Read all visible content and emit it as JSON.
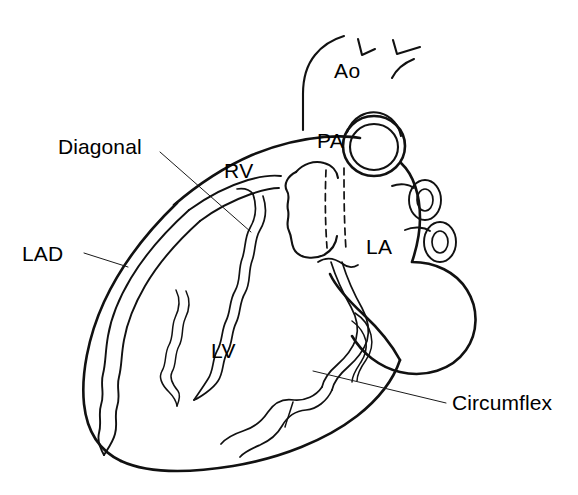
{
  "figure": {
    "background_color": "#ffffff",
    "ink_color": "#111111",
    "width": 578,
    "height": 495
  },
  "callout_labels": [
    {
      "id": "diagonal",
      "text": "Diagonal",
      "x": 58,
      "y": 136,
      "leader_from": [
        160,
        152
      ],
      "leader_to": [
        251,
        232
      ]
    },
    {
      "id": "lad",
      "text": "LAD",
      "x": 22,
      "y": 243,
      "leader_from": [
        84,
        253
      ],
      "leader_to": [
        128,
        267
      ]
    },
    {
      "id": "circumflex",
      "text": "Circumflex",
      "x": 452,
      "y": 392,
      "leader_from": [
        446,
        403
      ],
      "leader_to": [
        313,
        371
      ]
    }
  ],
  "chamber_labels": [
    {
      "id": "ao",
      "text": "Ao",
      "x": 334,
      "y": 60,
      "description": "Aorta"
    },
    {
      "id": "pa",
      "text": "PA",
      "x": 317,
      "y": 130,
      "description": "Pulmonary artery"
    },
    {
      "id": "rv",
      "text": "RV",
      "x": 224,
      "y": 160,
      "description": "Right ventricle"
    },
    {
      "id": "la",
      "text": "LA",
      "x": 366,
      "y": 236,
      "description": "Left atrium"
    },
    {
      "id": "lv",
      "text": "LV",
      "x": 211,
      "y": 340,
      "description": "Left ventricle"
    }
  ],
  "structures": [
    {
      "id": "aortic-arch",
      "name": "aortic arch"
    },
    {
      "id": "arch-branch-vessels",
      "name": "brachiocephalic and carotid stubs"
    },
    {
      "id": "pulmonary-trunk",
      "name": "pulmonary trunk cross-section"
    },
    {
      "id": "right-atrial-appendage",
      "name": "right atrial appendage"
    },
    {
      "id": "pulmonary-veins",
      "name": "pulmonary vein cross-sections"
    },
    {
      "id": "left-atrium-body",
      "name": "left atrium body"
    },
    {
      "id": "ventricular-mass",
      "name": "ventricular silhouette"
    },
    {
      "id": "lad-artery",
      "name": "left anterior descending artery"
    },
    {
      "id": "diagonal-artery",
      "name": "diagonal branch"
    },
    {
      "id": "circumflex-artery",
      "name": "circumflex artery"
    },
    {
      "id": "hidden-segment",
      "name": "left main artery hidden behind pulmonary trunk"
    }
  ]
}
